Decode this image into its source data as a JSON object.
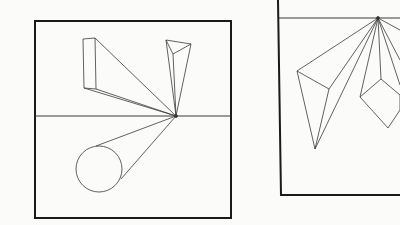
{
  "figure": {
    "panels": [
      {
        "name": "left-panel",
        "description": "Vanishing point on horizon line with box, triangular prism and cylinder"
      },
      {
        "name": "right-panel",
        "description": "Vanishing point at top with triangular prism and cube"
      }
    ]
  },
  "colors": {
    "line": "#333333",
    "frame": "#1a1a1a",
    "background": "#fbfbf9"
  }
}
